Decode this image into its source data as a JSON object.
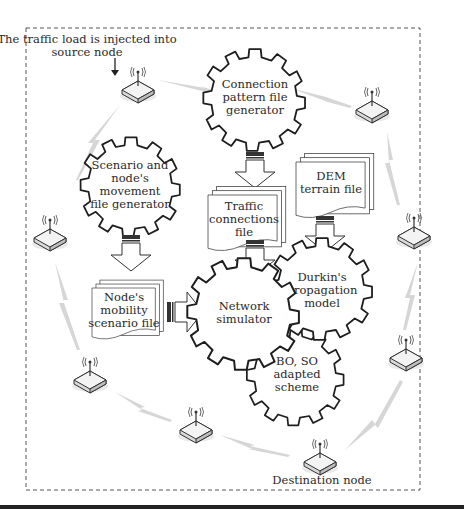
{
  "diagram": {
    "annotations": {
      "source_label_line1": "The traffic load is injected into",
      "source_label_line2": "source node",
      "destination_label": "Destination node"
    },
    "gears": [
      {
        "id": "connection-pattern",
        "lines": [
          "Connection",
          "pattern file",
          "generator"
        ]
      },
      {
        "id": "scenario-movement",
        "lines": [
          "Scenario and",
          "node's",
          "movement",
          "file generator"
        ]
      },
      {
        "id": "network-simulator",
        "lines": [
          "Network",
          "simulator"
        ]
      },
      {
        "id": "durkin-model",
        "lines": [
          "Durkin's",
          "propagation",
          "model"
        ]
      },
      {
        "id": "bo-so-scheme",
        "lines": [
          "BO, SO",
          "adapted",
          "scheme"
        ]
      }
    ],
    "documents": [
      {
        "id": "traffic-connections",
        "lines": [
          "Traffic",
          "connections",
          "file"
        ]
      },
      {
        "id": "dem-terrain",
        "lines": [
          "DEM",
          "terrain file"
        ]
      },
      {
        "id": "mobility-scenario",
        "lines": [
          "Node's",
          "mobility",
          "scenario file"
        ]
      }
    ],
    "nodes": [
      {
        "id": "source",
        "x": 138,
        "y": 90
      },
      {
        "id": "n2",
        "x": 372,
        "y": 110
      },
      {
        "id": "n3",
        "x": 50,
        "y": 238
      },
      {
        "id": "n4",
        "x": 414,
        "y": 236
      },
      {
        "id": "n5",
        "x": 90,
        "y": 380
      },
      {
        "id": "n6",
        "x": 406,
        "y": 358
      },
      {
        "id": "n7",
        "x": 196,
        "y": 430
      },
      {
        "id": "destination",
        "x": 320,
        "y": 462
      }
    ],
    "colors": {
      "stroke": "#1e1e1e",
      "link": "#c8c8c8",
      "border": "#555555"
    }
  }
}
